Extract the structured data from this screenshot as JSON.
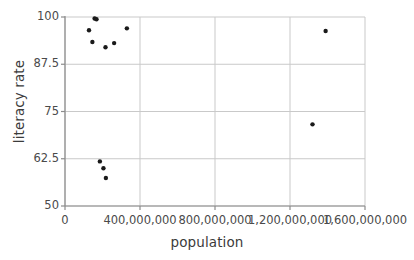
{
  "chart_data": {
    "type": "scatter",
    "title": "",
    "xlabel": "population",
    "ylabel": "literacy rate",
    "xlim": [
      0,
      1600000000
    ],
    "ylim": [
      50,
      100
    ],
    "grid": true,
    "legend": "none",
    "xticks": [
      0,
      400000000,
      800000000,
      1200000000,
      1600000000
    ],
    "xtick_labels": [
      "0",
      "400,000,000",
      "800,000,000",
      "1,200,000,000",
      "1,600,000,000"
    ],
    "yticks": [
      50,
      62.5,
      75,
      87.5,
      100
    ],
    "ytick_labels": [
      "50",
      "62.5",
      "75",
      "87.5",
      "100"
    ],
    "marker": {
      "shape": "circle",
      "color": "#1a1a1a",
      "size_px": 4.4
    },
    "points": [
      {
        "x": 128000000,
        "y": 96.5
      },
      {
        "x": 146000000,
        "y": 93.4
      },
      {
        "x": 158000000,
        "y": 99.6
      },
      {
        "x": 168000000,
        "y": 99.4
      },
      {
        "x": 186000000,
        "y": 61.8
      },
      {
        "x": 205000000,
        "y": 60.0
      },
      {
        "x": 216000000,
        "y": 92.0
      },
      {
        "x": 218000000,
        "y": 57.4
      },
      {
        "x": 262000000,
        "y": 93.1
      },
      {
        "x": 330000000,
        "y": 97.0
      },
      {
        "x": 1320000000,
        "y": 71.6
      },
      {
        "x": 1390000000,
        "y": 96.3
      }
    ],
    "series": [
      {
        "name": "countries",
        "x": [
          128000000,
          146000000,
          158000000,
          168000000,
          186000000,
          205000000,
          216000000,
          218000000,
          262000000,
          330000000,
          1320000000,
          1390000000
        ],
        "y": [
          96.5,
          93.4,
          99.6,
          99.4,
          61.8,
          60.0,
          92.0,
          57.4,
          93.1,
          97.0,
          71.6,
          96.3
        ]
      }
    ],
    "colors": {
      "marker": "#1a1a1a",
      "grid": "#c9c9c9",
      "axis": "#8c8c8c",
      "text": "#4a4a4a"
    }
  }
}
